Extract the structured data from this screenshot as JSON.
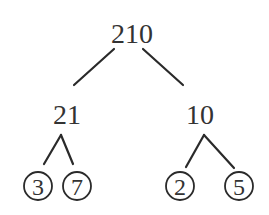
{
  "diagram": {
    "type": "factor-tree",
    "root": {
      "value": "210",
      "children": [
        {
          "value": "21",
          "children": [
            {
              "value": "3",
              "prime": true
            },
            {
              "value": "7",
              "prime": true
            }
          ]
        },
        {
          "value": "10",
          "children": [
            {
              "value": "2",
              "prime": true
            },
            {
              "value": "5",
              "prime": true
            }
          ]
        }
      ]
    },
    "style": {
      "line_color": "#2a2a2a",
      "text_color": "#333333",
      "background": "#ffffff"
    }
  }
}
